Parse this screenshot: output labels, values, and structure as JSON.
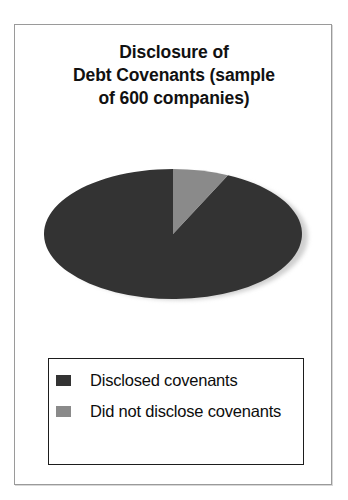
{
  "figure": {
    "title_lines": [
      "Disclosure of",
      "Debt Covenants (sample",
      "of 600 companies)"
    ],
    "border_color": "#9a9a9a"
  },
  "legend": {
    "items": [
      {
        "label": "Disclosed covenants",
        "color": "#333333",
        "swatch_name": "legend-swatch-disclosed"
      },
      {
        "label": "Did not disclose covenants",
        "color": "#8a8a8a",
        "swatch_name": "legend-swatch-not-disclosed"
      }
    ],
    "border_color": "#1d1d1d"
  },
  "chart_data": {
    "type": "pie",
    "title": "Disclosure of Debt Covenants (sample of 600 companies)",
    "categories": [
      "Disclosed covenants",
      "Did not disclose covenants"
    ],
    "values": [
      93,
      7
    ],
    "value_unit": "percent",
    "counts": [
      558,
      42
    ],
    "sample_size": 600,
    "colors": [
      "#333333",
      "#8a8a8a"
    ],
    "start_angle_deg": -90,
    "direction": "counterclockwise",
    "legend_position": "bottom",
    "grid": false,
    "shape": "ellipse",
    "shadow": true,
    "data_labels_shown": false
  }
}
